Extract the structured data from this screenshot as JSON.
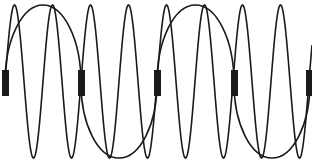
{
  "diagram": {
    "stroke_color": "#1a1a1a",
    "block_color": "#1a1a1a",
    "background": "#ffffff",
    "blocks": [
      {
        "x": 2,
        "y": 70,
        "w": 7,
        "h": 26
      },
      {
        "x": 78,
        "y": 70,
        "w": 7,
        "h": 26
      },
      {
        "x": 154,
        "y": 70,
        "w": 7,
        "h": 26
      },
      {
        "x": 231,
        "y": 70,
        "w": 7,
        "h": 26
      },
      {
        "x": 306,
        "y": 70,
        "w": 6,
        "h": 26
      }
    ],
    "large_arcs": [
      {
        "from_x": 5,
        "to_x": 81,
        "peak_y": 5,
        "side": "top"
      },
      {
        "from_x": 81,
        "to_x": 157,
        "peak_y": 158,
        "side": "bottom"
      },
      {
        "from_x": 157,
        "to_x": 234,
        "peak_y": 5,
        "side": "top"
      },
      {
        "from_x": 234,
        "to_x": 310,
        "peak_y": 158,
        "side": "bottom"
      }
    ],
    "helix": {
      "top_y": 5,
      "bottom_y": 158,
      "period_px": 38,
      "start_x": 5
    }
  }
}
